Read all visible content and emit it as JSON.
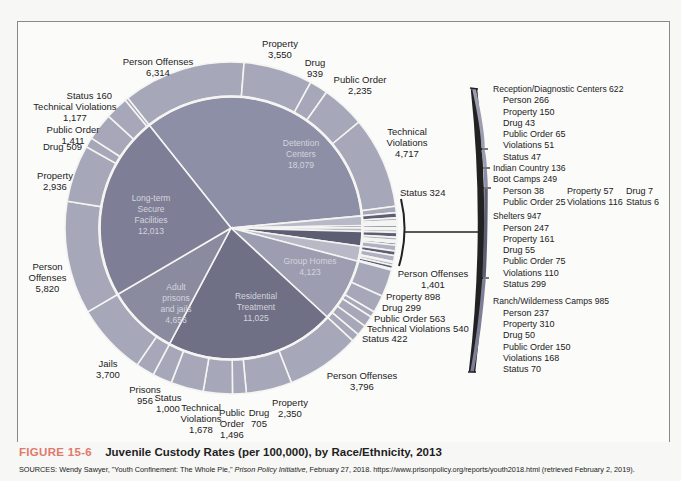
{
  "figure": {
    "label": "FIGURE 15-6",
    "title": "Juvenile Custody Rates (per 100,000), by Race/Ethnicity, 2013",
    "sources_prefix": "SOURCES: Wendy Sawyer, \"Youth Confinement: The Whole Pie,\" ",
    "sources_italic": "Prison Policy Initiative",
    "sources_suffix": ", February 27, 2018. https://www.prisonpolicy.org/reports/youth2018.html (retrieved February 2, 2019)."
  },
  "colors": {
    "detention": "#8d8fa6",
    "long_term": "#7e7f96",
    "adult": "#8a8b9f",
    "residential": "#6f6f86",
    "group_homes": "#9c9db0",
    "outer_ring": "#a6a7b8",
    "dark_small": "#5d5e72",
    "figure_label": "#e07a6a",
    "background": "#f7f7f5"
  },
  "chart_data": {
    "type": "pie",
    "subtype": "nested donut (sunburst)",
    "title": "Juvenile Custody Rates (per 100,000), by Race/Ethnicity, 2013",
    "inner": [
      {
        "name": "Detention Centers",
        "value": 18079
      },
      {
        "name": "Reception/Diagnostic Centers",
        "value": 622
      },
      {
        "name": "Indian Country",
        "value": 136
      },
      {
        "name": "Boot Camps",
        "value": 249
      },
      {
        "name": "Shelters",
        "value": 947
      },
      {
        "name": "Ranch/Wilderness Camps",
        "value": 985
      },
      {
        "name": "Group Homes",
        "value": 4123
      },
      {
        "name": "Residential Treatment",
        "value": 11025
      },
      {
        "name": "Adult prisons and jails",
        "value": 4656
      },
      {
        "name": "Long-term Secure Facilities",
        "value": 12013
      }
    ],
    "outer": {
      "Detention Centers": [
        {
          "name": "Person Offenses",
          "value": 6314
        },
        {
          "name": "Property",
          "value": 3550
        },
        {
          "name": "Drug",
          "value": 939
        },
        {
          "name": "Public Order",
          "value": 2235
        },
        {
          "name": "Technical Violations",
          "value": 4717
        },
        {
          "name": "Status",
          "value": 324
        }
      ],
      "Reception/Diagnostic Centers": [
        {
          "name": "Person",
          "value": 266
        },
        {
          "name": "Property",
          "value": 150
        },
        {
          "name": "Drug",
          "value": 43
        },
        {
          "name": "Public Order",
          "value": 65
        },
        {
          "name": "Violations",
          "value": 51
        },
        {
          "name": "Status",
          "value": 47
        }
      ],
      "Indian Country": [
        {
          "name": "Indian Country",
          "value": 136
        }
      ],
      "Boot Camps": [
        {
          "name": "Person",
          "value": 38
        },
        {
          "name": "Property",
          "value": 57
        },
        {
          "name": "Drug",
          "value": 7
        },
        {
          "name": "Public Order",
          "value": 25
        },
        {
          "name": "Violations",
          "value": 116
        },
        {
          "name": "Status",
          "value": 6
        }
      ],
      "Shelters": [
        {
          "name": "Person",
          "value": 247
        },
        {
          "name": "Property",
          "value": 161
        },
        {
          "name": "Drug",
          "value": 55
        },
        {
          "name": "Public Order",
          "value": 75
        },
        {
          "name": "Violations",
          "value": 110
        },
        {
          "name": "Status",
          "value": 299
        }
      ],
      "Ranch/Wilderness Camps": [
        {
          "name": "Person",
          "value": 237
        },
        {
          "name": "Property",
          "value": 310
        },
        {
          "name": "Drug",
          "value": 50
        },
        {
          "name": "Public Order",
          "value": 150
        },
        {
          "name": "Violations",
          "value": 168
        },
        {
          "name": "Status",
          "value": 70
        }
      ],
      "Group Homes": [
        {
          "name": "Person Offenses",
          "value": 1401
        },
        {
          "name": "Property",
          "value": 898
        },
        {
          "name": "Drug",
          "value": 299
        },
        {
          "name": "Public Order",
          "value": 563
        },
        {
          "name": "Technical Violations",
          "value": 540
        },
        {
          "name": "Status",
          "value": 422
        }
      ],
      "Residential Treatment": [
        {
          "name": "Person Offenses",
          "value": 3796
        },
        {
          "name": "Property",
          "value": 2350
        },
        {
          "name": "Drug",
          "value": 705
        },
        {
          "name": "Public Order",
          "value": 1496
        },
        {
          "name": "Technical Violations",
          "value": 1678
        },
        {
          "name": "Status",
          "value": 1000
        }
      ],
      "Adult prisons and jails": [
        {
          "name": "Prisons",
          "value": 956
        },
        {
          "name": "Jails",
          "value": 3700
        }
      ],
      "Long-term Secure Facilities": [
        {
          "name": "Person Offenses",
          "value": 5820
        },
        {
          "name": "Property",
          "value": 2936
        },
        {
          "name": "Drug",
          "value": 509
        },
        {
          "name": "Public Order",
          "value": 1411
        },
        {
          "name": "Technical Violations",
          "value": 1177
        },
        {
          "name": "Status",
          "value": 160
        }
      ]
    },
    "legend": "callout list at right for small facility types"
  },
  "inner_labels": {
    "detention": {
      "line1": "Detention",
      "line2": "Centers",
      "value": "18,079"
    },
    "long_term": {
      "line1": "Long-term",
      "line2": "Secure",
      "line3": "Facilities",
      "value": "12,013"
    },
    "adult": {
      "line1": "Adult",
      "line2": "prisons",
      "line3": "and jails",
      "value": "4,656"
    },
    "residential": {
      "line1": "Residential",
      "line2": "Treatment",
      "value": "11,025"
    },
    "group_homes": {
      "line1": "Group Homes",
      "value": "4,123"
    }
  },
  "outer_labels": {
    "det_person": {
      "name": "Person Offenses",
      "value": "6,314"
    },
    "det_property": {
      "name": "Property",
      "value": "3,550"
    },
    "det_drug": {
      "name": "Drug",
      "value": "939"
    },
    "det_public": {
      "name": "Public Order",
      "value": "2,235"
    },
    "det_tech": {
      "line1": "Technical",
      "line2": "Violations",
      "value": "4,717"
    },
    "det_status": "Status 324",
    "lt_status": "Status 160",
    "lt_tech": {
      "name": "Technical Violations",
      "value": "1,177"
    },
    "lt_public": {
      "name": "Public Order",
      "value": "1,411"
    },
    "lt_drug": "Drug 509",
    "lt_property": {
      "name": "Property",
      "value": "2,936"
    },
    "lt_person": {
      "line1": "Person",
      "line2": "Offenses",
      "value": "5,820"
    },
    "jails": {
      "name": "Jails",
      "value": "3,700"
    },
    "prisons": {
      "name": "Prisons",
      "value": "956"
    },
    "rt_status": {
      "name": "Status",
      "value": "1,000"
    },
    "rt_tech": {
      "line1": "Technical",
      "line2": "Violations",
      "value": "1,678"
    },
    "rt_public": {
      "line1": "Public",
      "line2": "Order",
      "value": "1,496"
    },
    "rt_drug": {
      "name": "Drug",
      "value": "705"
    },
    "rt_property": {
      "name": "Property",
      "value": "2,350"
    },
    "rt_person": {
      "name": "Person Offenses",
      "value": "3,796"
    },
    "gh_person": {
      "name": "Person Offenses",
      "value": "1,401"
    },
    "gh_property": "Property 898",
    "gh_drug": "Drug 299",
    "gh_public": "Public Order 563",
    "gh_tech": "Technical Violations 540",
    "gh_status": "Status 422"
  },
  "legend": {
    "reception": {
      "title": "Reception/Diagnostic Centers 622",
      "items": [
        "Person 266",
        "Property 150",
        "Drug 43",
        "Public Order 65",
        "Violations 51",
        "Status 47"
      ]
    },
    "indian": {
      "title": "Indian Country 136"
    },
    "boot": {
      "title": "Boot Camps 249",
      "row1": [
        "Person 38",
        "Property 57",
        "Drug 7"
      ],
      "row2": [
        "Public Order 25",
        "Violations 116",
        "Status 6"
      ]
    },
    "shelters": {
      "title": "Shelters 947",
      "items": [
        "Person 247",
        "Property 161",
        "Drug 55",
        "Public Order 75",
        "Violations 110",
        "Status 299"
      ]
    },
    "ranch": {
      "title": "Ranch/Wilderness Camps 985",
      "items": [
        "Person 237",
        "Property 310",
        "Drug 50",
        "Public Order 150",
        "Violations 168",
        "Status 70"
      ]
    }
  }
}
